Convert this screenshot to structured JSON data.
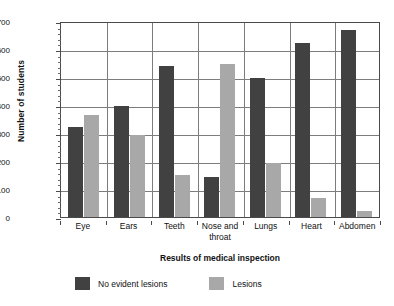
{
  "chart_data": {
    "type": "bar",
    "title": "",
    "subtitle": "",
    "xlabel": "Results of medical inspection",
    "ylabel": "Number of students",
    "ylim": [
      0,
      700
    ],
    "ytick_step": 100,
    "yticks": [
      0,
      100,
      200,
      300,
      400,
      500,
      600,
      700
    ],
    "ytick_labels": [
      "0",
      "100",
      "200",
      "300",
      "400",
      "500",
      "600",
      "700"
    ],
    "grid": "horizontal-and-vertical",
    "legend_position": "bottom-left",
    "categories": [
      "Eye",
      "Ears",
      "Teeth",
      "Nose and throat",
      "Lungs",
      "Heart",
      "Abdomen"
    ],
    "category_labels": [
      [
        "Eye"
      ],
      [
        "Ears"
      ],
      [
        "Teeth"
      ],
      [
        "Nose and",
        "throat"
      ],
      [
        "Lungs"
      ],
      [
        "Heart"
      ],
      [
        "Abdomen"
      ]
    ],
    "series": [
      {
        "name": "No evident lesions",
        "color": "#414141",
        "values": [
          321,
          396,
          538,
          143,
          497,
          620,
          667
        ]
      },
      {
        "name": "Lesions",
        "color": "#a8a8a8",
        "values": [
          364,
          293,
          149,
          545,
          192,
          68,
          22
        ]
      }
    ]
  },
  "legend": {
    "items": [
      {
        "label": "No evident lesions",
        "swatch": "dark"
      },
      {
        "label": "Lesions",
        "swatch": "light"
      }
    ]
  },
  "colors": {
    "series_dark": "#414141",
    "series_light": "#a8a8a8",
    "axis": "#4a4a4a",
    "grid": "#7d7d7d",
    "background": "#ffffff",
    "text": "#111111"
  }
}
